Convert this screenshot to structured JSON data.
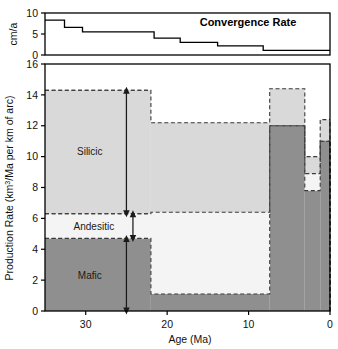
{
  "figure": {
    "background": "#ffffff",
    "frame_color": "#000000"
  },
  "chart_data": [
    {
      "id": "convergence",
      "type": "line",
      "title": "Convergence Rate",
      "xlabel": "",
      "ylabel": "cm/a",
      "ylim": [
        0,
        10
      ],
      "yticks": [
        0,
        5,
        10
      ],
      "xlim": [
        35,
        0
      ],
      "grid": false,
      "step_style": "post",
      "x": [
        35,
        32.5,
        30.5,
        22,
        18.5,
        14,
        8.5,
        0
      ],
      "values": [
        8.3,
        6.6,
        5.5,
        5.5,
        4.0,
        3.0,
        2.2,
        1.1
      ],
      "segments": [
        {
          "x_start": 35.0,
          "x_end": 32.6,
          "y": 8.3
        },
        {
          "x_start": 32.6,
          "x_end": 30.4,
          "y": 6.6
        },
        {
          "x_start": 30.4,
          "x_end": 21.6,
          "y": 5.5
        },
        {
          "x_start": 21.6,
          "x_end": 18.4,
          "y": 4.0
        },
        {
          "x_start": 18.4,
          "x_end": 13.8,
          "y": 3.0
        },
        {
          "x_start": 13.8,
          "x_end": 8.2,
          "y": 2.2
        },
        {
          "x_start": 8.2,
          "x_end": 0.0,
          "y": 1.1
        }
      ],
      "line_color": "#000000",
      "line_width": 1.4
    },
    {
      "id": "production",
      "type": "area",
      "title": "",
      "xlabel": "Age (Ma)",
      "ylabel_parts": {
        "pre": "Production Rate (km",
        "sup": "3",
        "post": "/Ma per km of arc)"
      },
      "ylabel": "Production Rate (km3/Ma per km of arc)",
      "ylim": [
        0,
        16
      ],
      "yticks": [
        0,
        2,
        4,
        6,
        8,
        10,
        12,
        14,
        16
      ],
      "xlim": [
        35,
        0
      ],
      "xticks": [
        30,
        20,
        10,
        0
      ],
      "grid": false,
      "stacked": true,
      "series": [
        {
          "name": "Mafic",
          "color": "#8f8f8f",
          "edge": "#404040",
          "edge_style": "dashed",
          "steps": [
            {
              "x_start": 35.0,
              "x_end": 22.0,
              "value": 4.7
            },
            {
              "x_start": 22.0,
              "x_end": 7.4,
              "value": 1.1
            },
            {
              "x_start": 7.4,
              "x_end": 3.1,
              "value": 12.0
            },
            {
              "x_start": 3.1,
              "x_end": 1.2,
              "value": 7.8
            },
            {
              "x_start": 1.2,
              "x_end": 0.0,
              "value": 11.0
            }
          ]
        },
        {
          "name": "Andesitic",
          "color": "#f4f4f4",
          "edge": "#404040",
          "edge_style": "dashed",
          "steps": [
            {
              "x_start": 35.0,
              "x_end": 22.0,
              "value": 1.6
            },
            {
              "x_start": 22.0,
              "x_end": 7.4,
              "value": 5.3
            },
            {
              "x_start": 7.4,
              "x_end": 3.1,
              "value": 0.0
            },
            {
              "x_start": 3.1,
              "x_end": 1.2,
              "value": 1.1
            },
            {
              "x_start": 1.2,
              "x_end": 0.0,
              "value": 0.0
            }
          ]
        },
        {
          "name": "Silicic",
          "color": "#d9d9d9",
          "edge": "#404040",
          "edge_style": "dashed",
          "steps": [
            {
              "x_start": 35.0,
              "x_end": 22.0,
              "value": 8.0
            },
            {
              "x_start": 22.0,
              "x_end": 7.4,
              "value": 5.8
            },
            {
              "x_start": 7.4,
              "x_end": 3.1,
              "value": 2.4
            },
            {
              "x_start": 3.1,
              "x_end": 1.2,
              "value": 1.1
            },
            {
              "x_start": 1.2,
              "x_end": 0.0,
              "value": 1.4
            }
          ]
        }
      ],
      "annotations": [
        {
          "name": "silicic",
          "label": "Silicic",
          "label_x": 29.5,
          "label_y": 10.3,
          "arrow_x": 25.0,
          "arrow_y0": 6.3,
          "arrow_y1": 14.3
        },
        {
          "name": "andesitic",
          "label": "Andesitic",
          "label_x": 29.0,
          "label_y": 5.5,
          "arrow_x": 24.2,
          "arrow_y0": 4.7,
          "arrow_y1": 6.3
        },
        {
          "name": "mafic",
          "label": "Mafic",
          "label_x": 29.5,
          "label_y": 2.3,
          "arrow_x": 25.0,
          "arrow_y0": 0.0,
          "arrow_y1": 4.7
        }
      ],
      "level_lines": [
        {
          "y": 14.3,
          "x_start": 35.0,
          "x_end": 22.0
        },
        {
          "y": 6.3,
          "x_start": 35.0,
          "x_end": 22.0
        },
        {
          "y": 4.7,
          "x_start": 35.0,
          "x_end": 22.0
        }
      ]
    }
  ]
}
